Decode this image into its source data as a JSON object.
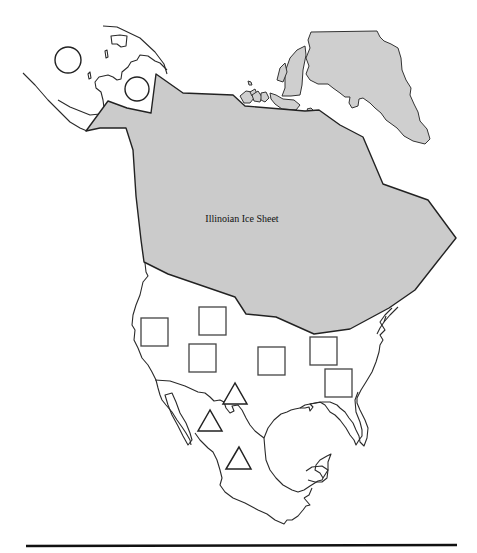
{
  "map": {
    "title": "",
    "region": "North America",
    "ice_sheet": {
      "label": "Illinoian Ice Sheet",
      "fill_color": "#cbcbcb",
      "outline_color": "#222222"
    },
    "greenland": {
      "fill_color": "#cfcfcf"
    },
    "legend_symbols": [
      {
        "shape": "circle",
        "count": 2,
        "region": "Alaska / Beringia"
      },
      {
        "shape": "square",
        "count": 6,
        "region": "United States (south of ice sheet)"
      },
      {
        "shape": "triangle",
        "count": 3,
        "region": "Mexico"
      }
    ],
    "markers": {
      "circles": [
        {
          "cx": 68,
          "cy": 60,
          "r": 13
        },
        {
          "cx": 137,
          "cy": 89,
          "r": 12
        }
      ],
      "squares": [
        {
          "x": 141,
          "y": 318,
          "w": 27,
          "h": 28
        },
        {
          "x": 199,
          "y": 307,
          "w": 27,
          "h": 28
        },
        {
          "x": 189,
          "y": 344,
          "w": 27,
          "h": 28
        },
        {
          "x": 258,
          "y": 347,
          "w": 27,
          "h": 28
        },
        {
          "x": 310,
          "y": 337,
          "w": 27,
          "h": 28
        },
        {
          "x": 325,
          "y": 369,
          "w": 27,
          "h": 28
        }
      ],
      "triangles": [
        {
          "apex": [
            235,
            383
          ],
          "left": [
            223,
            404
          ],
          "right": [
            247,
            404
          ]
        },
        {
          "apex": [
            210,
            410
          ],
          "left": [
            198,
            431
          ],
          "right": [
            222,
            431
          ]
        },
        {
          "apex": [
            239,
            447
          ],
          "left": [
            226,
            469
          ],
          "right": [
            251,
            469
          ]
        }
      ]
    },
    "colors": {
      "background": "#ffffff",
      "coastline": "#2a2a2a",
      "marker_stroke": "#444444",
      "rule": "#111111"
    }
  }
}
